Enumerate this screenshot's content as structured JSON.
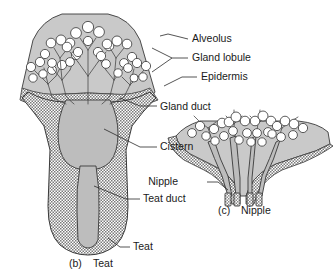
{
  "figure": {
    "title_alt": "Comparative anatomy of teat and nipple",
    "background_color": "#ffffff",
    "tissue_fill": "#c9c9c9",
    "lumen_fill": "#b8b8b8",
    "hatch_color": "#6e6e6e",
    "alveolus_fill": "#ffffff",
    "outline_color": "#3a3a3a",
    "text_color": "#1a1a1a"
  },
  "labels": [
    {
      "id": "alveolus",
      "text": "Alveolus",
      "x": 192,
      "y": 42
    },
    {
      "id": "gland-lobule",
      "text": "Gland lobule",
      "x": 192,
      "y": 61
    },
    {
      "id": "epidermis",
      "text": "Epidermis",
      "x": 201,
      "y": 80
    },
    {
      "id": "gland-duct",
      "text": "Gland duct",
      "x": 160,
      "y": 110
    },
    {
      "id": "cistern",
      "text": "Cistern",
      "x": 160,
      "y": 150
    },
    {
      "id": "nipple",
      "text": "Nipple",
      "x": 178,
      "y": 185
    },
    {
      "id": "teat-duct",
      "text": "Teat duct",
      "x": 143,
      "y": 202
    },
    {
      "id": "teat-leader",
      "text": "Teat",
      "x": 133,
      "y": 250
    }
  ],
  "captions": [
    {
      "id": "caption-b",
      "marker": "(b)",
      "text": "Teat",
      "marker_x": 69,
      "text_x": 93,
      "y": 267
    },
    {
      "id": "caption-c",
      "marker": "(c)",
      "text": "Nipple",
      "marker_x": 218,
      "text_x": 241,
      "y": 214
    }
  ],
  "panels": {
    "teat": {
      "id": "panel-teat",
      "name": "teat",
      "lobule_count": 5,
      "alveoli_count": 46
    },
    "nipple": {
      "id": "panel-nipple",
      "name": "nipple",
      "lobule_count": 4,
      "alveoli_count": 31,
      "duct_openings": 4
    }
  }
}
